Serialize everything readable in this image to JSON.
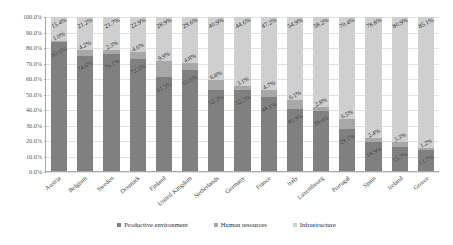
{
  "chart_data": {
    "type": "bar",
    "subtype": "stacked-bar-100-percent",
    "title": "",
    "xlabel": "",
    "ylabel": "",
    "ylim": [
      0,
      100
    ],
    "ytick_labels": [
      "100.0%",
      "90.0%",
      "80.0%",
      "70.0%",
      "60.0%",
      "50.0%",
      "40.0%",
      "30.0%",
      "20.0%",
      "10.0%",
      "0.0%"
    ],
    "ytick_values": [
      100,
      90,
      80,
      70,
      60,
      50,
      40,
      30,
      20,
      10,
      0
    ],
    "grid": true,
    "legend_position": "bottom",
    "categories": [
      "Austria",
      "Belgium",
      "Sweden",
      "Denmark",
      "Finland",
      "United Kingdom",
      "Netherlands",
      "Germany",
      "France",
      "Italy",
      "Luxembourg",
      "Portugal",
      "Spain",
      "Ireland",
      "Greece"
    ],
    "series": [
      {
        "name": "Productive environment",
        "color": "#808080",
        "values": [
          83.6,
          74.6,
          76.1,
          72.5,
          61.3,
          65.6,
          52.3,
          52.3,
          48.1,
          40.9,
          39.0,
          29.1,
          18.9,
          15.7,
          13.7
        ],
        "labels": [
          "83.6%",
          "74.6%",
          "76.1%",
          "72.5%",
          "61.3%",
          "65.6%",
          "52.3%",
          "52.3%",
          "48.1%",
          "40.9%",
          "39.0%",
          "29.1%",
          "18.9%",
          "15.7%",
          "13.7%"
        ]
      },
      {
        "name": "Human resources",
        "color": "#a8a8a8",
        "values": [
          1.0,
          4.2,
          2.3,
          4.6,
          9.9,
          4.8,
          6.8,
          3.1,
          4.7,
          6.1,
          2.8,
          6.5,
          2.4,
          3.3,
          1.2
        ],
        "labels": [
          "1.0%",
          "4.2%",
          "2.3%",
          "4.6%",
          "9.9%",
          "4.8%",
          "6.8%",
          "3.1%",
          "4.7%",
          "6.1%",
          "2.8%",
          "6.5%",
          "2.4%",
          "3.3%",
          "1.2%"
        ]
      },
      {
        "name": "Infrastructure",
        "color": "#cfcfcf",
        "values": [
          15.4,
          21.2,
          21.7,
          22.9,
          28.9,
          29.6,
          40.9,
          44.6,
          47.2,
          54.9,
          58.2,
          70.4,
          78.8,
          80.9,
          85.1
        ],
        "labels": [
          "15.4%",
          "21.2%",
          "21.7%",
          "22.9%",
          "28.9%",
          "29.6%",
          "40.9%",
          "44.6%",
          "47.2%",
          "54.9%",
          "58.2%",
          "70.4%",
          "78.8%",
          "80.9%",
          "85.1%"
        ]
      }
    ]
  },
  "legend": {
    "entries": [
      {
        "label": "Productive environment",
        "color": "#808080"
      },
      {
        "label": "Human resources",
        "color": "#a8a8a8"
      },
      {
        "label": "Infrastructure",
        "color": "#cfcfcf"
      }
    ]
  }
}
